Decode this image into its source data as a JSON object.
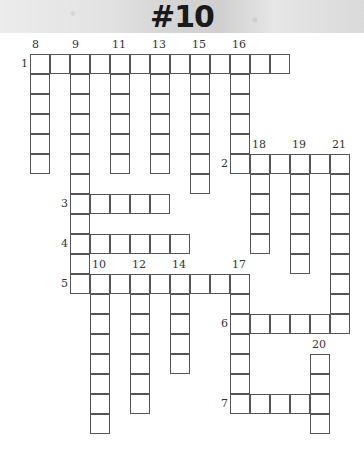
{
  "header": {
    "title": "#10"
  },
  "grid": {
    "origin_x": 30,
    "origin_y": 54,
    "cell_size": 20,
    "entries": [
      {
        "number": "1",
        "direction": "across",
        "row": 0,
        "col": 0,
        "length": 13
      },
      {
        "number": "2",
        "direction": "across",
        "row": 5,
        "col": 10,
        "length": 6
      },
      {
        "number": "3",
        "direction": "across",
        "row": 7,
        "col": 2,
        "length": 5
      },
      {
        "number": "4",
        "direction": "across",
        "row": 9,
        "col": 2,
        "length": 6
      },
      {
        "number": "5",
        "direction": "across",
        "row": 11,
        "col": 2,
        "length": 9
      },
      {
        "number": "6",
        "direction": "across",
        "row": 13,
        "col": 10,
        "length": 5
      },
      {
        "number": "7",
        "direction": "across",
        "row": 17,
        "col": 10,
        "length": 5
      },
      {
        "number": "8",
        "direction": "down",
        "row": 0,
        "col": 0,
        "length": 6
      },
      {
        "number": "9",
        "direction": "down",
        "row": 0,
        "col": 2,
        "length": 12
      },
      {
        "number": "10",
        "direction": "down",
        "row": 11,
        "col": 3,
        "length": 8
      },
      {
        "number": "11",
        "direction": "down",
        "row": 0,
        "col": 4,
        "length": 6
      },
      {
        "number": "12",
        "direction": "down",
        "row": 11,
        "col": 5,
        "length": 7
      },
      {
        "number": "13",
        "direction": "down",
        "row": 0,
        "col": 6,
        "length": 6
      },
      {
        "number": "14",
        "direction": "down",
        "row": 11,
        "col": 7,
        "length": 5
      },
      {
        "number": "15",
        "direction": "down",
        "row": 0,
        "col": 8,
        "length": 7
      },
      {
        "number": "16",
        "direction": "down",
        "row": 0,
        "col": 10,
        "length": 6
      },
      {
        "number": "17",
        "direction": "down",
        "row": 11,
        "col": 10,
        "length": 7
      },
      {
        "number": "18",
        "direction": "down",
        "row": 5,
        "col": 11,
        "length": 5
      },
      {
        "number": "19",
        "direction": "down",
        "row": 5,
        "col": 13,
        "length": 6
      },
      {
        "number": "20",
        "direction": "down",
        "row": 15,
        "col": 14,
        "length": 4
      },
      {
        "number": "21",
        "direction": "down",
        "row": 5,
        "col": 15,
        "length": 9
      }
    ]
  }
}
